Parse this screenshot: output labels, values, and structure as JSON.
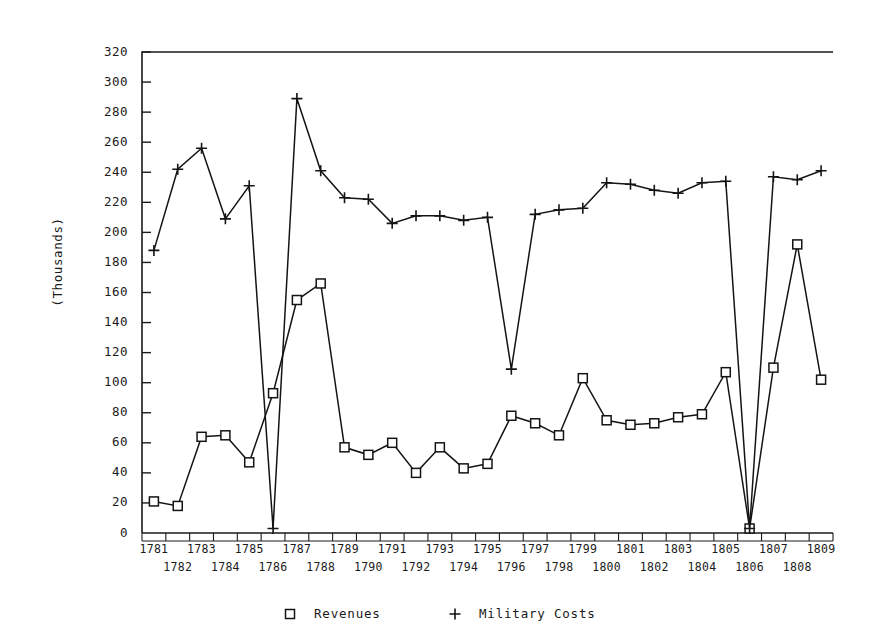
{
  "chart_data": {
    "type": "line",
    "title": "",
    "xlabel": "",
    "ylabel": "(Thousands)",
    "ylim": [
      0,
      320
    ],
    "ytick_step": 20,
    "grid": false,
    "legend_position": "bottom",
    "categories": [
      "1781",
      "1782",
      "1783",
      "1784",
      "1785",
      "1786",
      "1787",
      "1788",
      "1789",
      "1790",
      "1791",
      "1792",
      "1793",
      "1794",
      "1795",
      "1796",
      "1797",
      "1798",
      "1799",
      "1800",
      "1801",
      "1802",
      "1803",
      "1804",
      "1805",
      "1806",
      "1807",
      "1808",
      "1809"
    ],
    "yticks": [
      "0",
      "20",
      "40",
      "60",
      "80",
      "100",
      "120",
      "140",
      "160",
      "180",
      "200",
      "220",
      "240",
      "260",
      "280",
      "300",
      "320"
    ],
    "series": [
      {
        "name": "Revenues",
        "marker": "square",
        "values": [
          21,
          18,
          64,
          65,
          47,
          93,
          155,
          166,
          57,
          52,
          60,
          40,
          57,
          43,
          46,
          78,
          73,
          65,
          103,
          75,
          72,
          73,
          77,
          79,
          107,
          3,
          110,
          192,
          102
        ]
      },
      {
        "name": "Military Costs",
        "marker": "plus",
        "values": [
          188,
          242,
          256,
          209,
          231,
          3,
          289,
          241,
          223,
          222,
          206,
          211,
          211,
          208,
          210,
          109,
          212,
          215,
          216,
          233,
          232,
          228,
          226,
          233,
          234,
          3,
          237,
          235,
          241
        ]
      }
    ]
  },
  "legend": {
    "items": [
      {
        "label": "Revenues",
        "marker": "square-marker"
      },
      {
        "label": "Military Costs",
        "marker": "plus-marker"
      }
    ]
  }
}
